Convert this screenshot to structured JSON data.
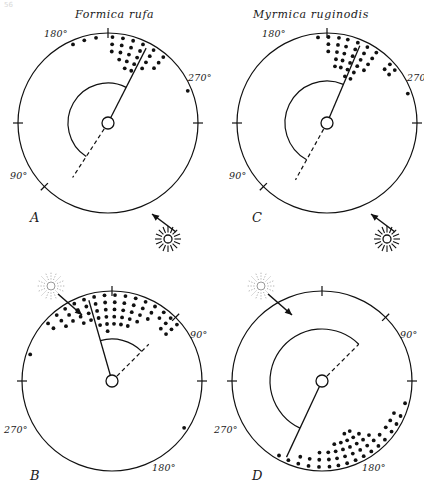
{
  "figure": {
    "corner_mark": "56",
    "background": "#ffffff",
    "ink": "#111111"
  },
  "titles": [
    {
      "id": "title-left",
      "text": "Formica rufa",
      "x": 75,
      "y": 8
    },
    {
      "id": "title-right",
      "text": "Myrmica ruginodis",
      "x": 253,
      "y": 8
    }
  ],
  "chart_data": {
    "type": "scatter",
    "plot_kind": "circular-histogram",
    "axis_units": "degrees",
    "axis_range": [
      0,
      360
    ],
    "grid": false,
    "legend": null,
    "panels": [
      {
        "letter": "A",
        "species": "Formica rufa",
        "label_x": 30,
        "label_y": 222,
        "cx": 108,
        "cy": 123,
        "r": 90,
        "hub_r": 6,
        "light_source": {
          "angle_deg": 315,
          "style": "solid-rays",
          "sun_cx": 168,
          "sun_cy": 239,
          "sun_r": 4,
          "rays": 16,
          "arrow_from": [
            176,
            232
          ],
          "arrow_to": [
            152,
            214
          ]
        },
        "ticks": [
          {
            "label": "180°",
            "angle_deg": 180,
            "lx": 44,
            "ly": 37
          },
          {
            "label": "270°",
            "angle_deg": 270,
            "lx": 188,
            "ly": 81
          },
          {
            "label": "90°",
            "angle_deg": 90,
            "lx": 10,
            "ly": 179
          }
        ],
        "mean_vector_deg": 153,
        "reference_dash_deg": 327,
        "arc": {
          "from_deg": 153,
          "to_deg": 327,
          "radius": 40
        },
        "bins": [
          {
            "angle_deg": 188,
            "count": 1
          },
          {
            "angle_deg": 196,
            "count": 1
          },
          {
            "angle_deg": 204,
            "count": 1
          },
          {
            "angle_deg": 148,
            "count": 4
          },
          {
            "angle_deg": 156,
            "count": 5
          },
          {
            "angle_deg": 163,
            "count": 5
          },
          {
            "angle_deg": 170,
            "count": 4
          },
          {
            "angle_deg": 177,
            "count": 3
          },
          {
            "angle_deg": 140,
            "count": 3
          },
          {
            "angle_deg": 112,
            "count": 1
          }
        ]
      },
      {
        "letter": "C",
        "species": "Myrmica ruginodis",
        "label_x": 252,
        "label_y": 222,
        "cx": 327,
        "cy": 123,
        "r": 90,
        "hub_r": 6,
        "light_source": {
          "angle_deg": 315,
          "style": "solid-rays",
          "sun_cx": 387,
          "sun_cy": 239,
          "sun_r": 4,
          "rays": 16,
          "arrow_from": [
            395,
            232
          ],
          "arrow_to": [
            371,
            214
          ]
        },
        "ticks": [
          {
            "label": "180°",
            "angle_deg": 180,
            "lx": 262,
            "ly": 37
          },
          {
            "label": "270°",
            "angle_deg": 270,
            "lx": 407,
            "ly": 81
          },
          {
            "label": "90°",
            "angle_deg": 90,
            "lx": 229,
            "ly": 179
          }
        ],
        "mean_vector_deg": 157,
        "reference_dash_deg": 331,
        "arc": {
          "from_deg": 157,
          "to_deg": 331,
          "radius": 42
        },
        "bins": [
          {
            "angle_deg": 186,
            "count": 1
          },
          {
            "angle_deg": 179,
            "count": 3
          },
          {
            "angle_deg": 172,
            "count": 5
          },
          {
            "angle_deg": 166,
            "count": 5
          },
          {
            "angle_deg": 159,
            "count": 6
          },
          {
            "angle_deg": 152,
            "count": 6
          },
          {
            "angle_deg": 145,
            "count": 4
          },
          {
            "angle_deg": 133,
            "count": 2
          },
          {
            "angle_deg": 128,
            "count": 2
          },
          {
            "angle_deg": 110,
            "count": 1
          }
        ]
      },
      {
        "letter": "B",
        "species": "Formica rufa",
        "label_x": 30,
        "label_y": 480,
        "cx": 112,
        "cy": 381,
        "r": 90,
        "hub_r": 6,
        "light_source": {
          "angle_deg": 135,
          "style": "dotted-rays",
          "sun_cx": 51,
          "sun_cy": 286,
          "sun_r": 4,
          "rays": 16,
          "arrow_from": [
            58,
            294
          ],
          "arrow_to": [
            82,
            315
          ]
        },
        "ticks": [
          {
            "label": "90°",
            "angle_deg": 90,
            "lx": 190,
            "ly": 338
          },
          {
            "label": "180°",
            "angle_deg": 180,
            "lx": 152,
            "ly": 471
          },
          {
            "label": "270°",
            "angle_deg": 270,
            "lx": 4,
            "ly": 433
          }
        ],
        "mean_vector_deg": 196,
        "reference_dash_deg": 135,
        "arc": {
          "from_deg": 135,
          "to_deg": 196,
          "radius": 42
        },
        "bins": [
          {
            "angle_deg": 57,
            "count": 1
          },
          {
            "angle_deg": 131,
            "count": 3
          },
          {
            "angle_deg": 137,
            "count": 3
          },
          {
            "angle_deg": 143,
            "count": 2
          },
          {
            "angle_deg": 150,
            "count": 3
          },
          {
            "angle_deg": 157,
            "count": 4
          },
          {
            "angle_deg": 164,
            "count": 5
          },
          {
            "angle_deg": 171,
            "count": 5
          },
          {
            "angle_deg": 178,
            "count": 5
          },
          {
            "angle_deg": 185,
            "count": 6
          },
          {
            "angle_deg": 192,
            "count": 5
          },
          {
            "angle_deg": 199,
            "count": 4
          },
          {
            "angle_deg": 206,
            "count": 4
          },
          {
            "angle_deg": 213,
            "count": 3
          },
          {
            "angle_deg": 220,
            "count": 3
          },
          {
            "angle_deg": 228,
            "count": 2
          },
          {
            "angle_deg": 252,
            "count": 1
          }
        ]
      },
      {
        "letter": "D",
        "species": "Myrmica ruginodis",
        "label_x": 252,
        "label_y": 480,
        "cx": 322,
        "cy": 381,
        "r": 90,
        "hub_r": 6,
        "light_source": {
          "angle_deg": 135,
          "style": "dotted-rays",
          "sun_cx": 261,
          "sun_cy": 286,
          "sun_r": 4,
          "rays": 16,
          "arrow_from": [
            268,
            294
          ],
          "arrow_to": [
            292,
            315
          ]
        },
        "ticks": [
          {
            "label": "90°",
            "angle_deg": 90,
            "lx": 400,
            "ly": 338
          },
          {
            "label": "180°",
            "angle_deg": 180,
            "lx": 362,
            "ly": 471
          },
          {
            "label": "270°",
            "angle_deg": 270,
            "lx": 214,
            "ly": 433
          },
          {
            "label": "",
            "angle_deg": 135,
            "lx": 0,
            "ly": 0
          }
        ],
        "mean_vector_deg": 335,
        "reference_dash_deg": 135,
        "arc": {
          "from_deg": 135,
          "to_deg": 335,
          "radius": 52
        },
        "bins": [
          {
            "angle_deg": 75,
            "count": 1
          },
          {
            "angle_deg": 66,
            "count": 2
          },
          {
            "angle_deg": 60,
            "count": 2
          },
          {
            "angle_deg": 54,
            "count": 2
          },
          {
            "angle_deg": 47,
            "count": 2
          },
          {
            "angle_deg": 41,
            "count": 3
          },
          {
            "angle_deg": 35,
            "count": 4
          },
          {
            "angle_deg": 29,
            "count": 5
          },
          {
            "angle_deg": 23,
            "count": 5
          },
          {
            "angle_deg": 17,
            "count": 4
          },
          {
            "angle_deg": 11,
            "count": 4
          },
          {
            "angle_deg": 5,
            "count": 3
          },
          {
            "angle_deg": 358,
            "count": 3
          },
          {
            "angle_deg": 351,
            "count": 2
          },
          {
            "angle_deg": 344,
            "count": 2
          },
          {
            "angle_deg": 337,
            "count": 1
          },
          {
            "angle_deg": 330,
            "count": 1
          }
        ]
      }
    ]
  }
}
